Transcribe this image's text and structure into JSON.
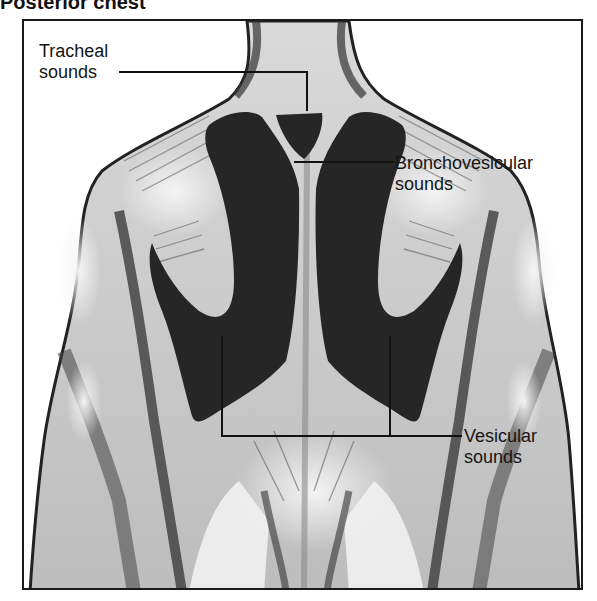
{
  "figure": {
    "title": "Posterior chest",
    "view": "posterior torso illustration with lung auscultation zones shaded dark"
  },
  "labels": {
    "tracheal": {
      "line1": "Tracheal",
      "line2": "sounds"
    },
    "bronchovesicular": {
      "line1": "Bronchovesicular",
      "line2": "sounds"
    },
    "vesicular": {
      "line1": "Vesicular",
      "line2": "sounds"
    }
  },
  "colors": {
    "frame": "#1a1a1a",
    "lung_zone": "#262626",
    "skin_light": "#e8e8e8",
    "skin_mid": "#a8a8a8",
    "skin_dark": "#555555",
    "leader_line": "#111111"
  }
}
